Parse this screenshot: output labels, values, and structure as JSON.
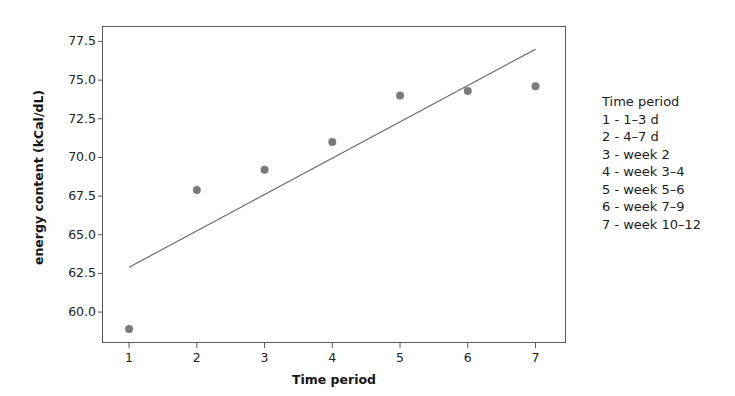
{
  "chart_data": {
    "type": "scatter",
    "title": "",
    "xlabel": "Time period",
    "ylabel": "energy content (kCal/dL)",
    "x": [
      1,
      2,
      3,
      4,
      5,
      6,
      7
    ],
    "values": [
      58.9,
      67.9,
      69.2,
      71.0,
      74.0,
      74.3,
      74.6
    ],
    "series": [
      {
        "name": "energy content",
        "type": "scatter",
        "x": [
          1,
          2,
          3,
          4,
          5,
          6,
          7
        ],
        "values": [
          58.9,
          67.9,
          69.2,
          71.0,
          74.0,
          74.3,
          74.6
        ],
        "marker_color": "#7a7a7a"
      },
      {
        "name": "regression line",
        "type": "line",
        "x": [
          1,
          7
        ],
        "values": [
          62.9,
          77.0
        ],
        "line_color": "#636363"
      }
    ],
    "xlim": [
      0.6,
      7.45
    ],
    "ylim": [
      58.0,
      78.5
    ],
    "xticks": [
      1,
      2,
      3,
      4,
      5,
      6,
      7
    ],
    "xtick_labels": [
      "1",
      "2",
      "3",
      "4",
      "5",
      "6",
      "7"
    ],
    "yticks": [
      60.0,
      62.5,
      65.0,
      67.5,
      70.0,
      72.5,
      75.0,
      77.5
    ],
    "ytick_labels": [
      "60.0",
      "62.5",
      "65.0",
      "67.5",
      "70.0",
      "72.5",
      "75.0",
      "77.5"
    ],
    "grid": false,
    "legend_position": "right-outside"
  },
  "legend": {
    "title": "Time period",
    "entries": [
      "1 - 1–3 d",
      "2 - 4–7 d",
      "3 - week 2",
      "4 - week 3–4",
      "5 - week 5–6",
      "6 - week 7–9",
      "7 - week 10–12"
    ]
  },
  "colors": {
    "marker": "#7a7a7a",
    "line": "#636363",
    "axis": "#5a5a5a",
    "text": "#1b1b1b",
    "background": "#ffffff"
  }
}
